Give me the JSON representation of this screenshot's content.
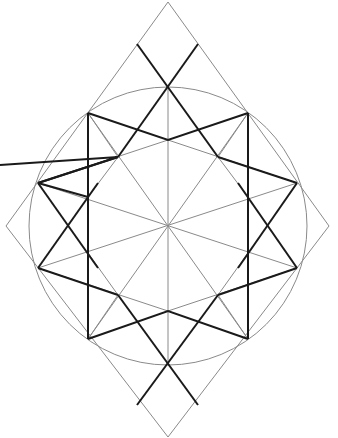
{
  "diagram": {
    "title": "",
    "colors": {
      "thin": "#8a8a8a",
      "thick": "#1a1a1a",
      "background": "#ffffff"
    },
    "center": [
      168,
      226
    ],
    "circle_radius": 139,
    "rhombus": [
      [
        168,
        2
      ],
      [
        329,
        226
      ],
      [
        168,
        437
      ],
      [
        6,
        226
      ]
    ],
    "star_points": [
      [
        88,
        113
      ],
      [
        168,
        87
      ],
      [
        248,
        113
      ],
      [
        297,
        183
      ],
      [
        297,
        268
      ],
      [
        248,
        339
      ],
      [
        168,
        363
      ],
      [
        88,
        339
      ],
      [
        38,
        268
      ],
      [
        38,
        183
      ]
    ]
  }
}
